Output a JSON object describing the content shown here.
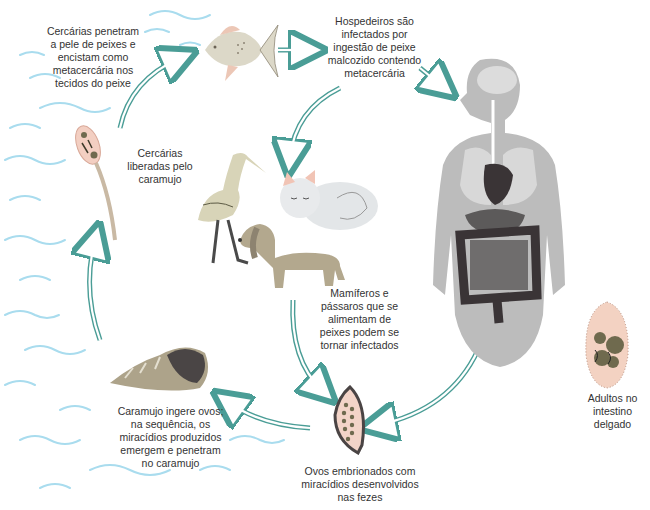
{
  "diagram": {
    "title": "",
    "type": "life-cycle",
    "stages": [
      {
        "id": "fish",
        "label": "Cercárias penetram\na pele de peixes e\nencistam como\nmetacercária nos\ntecidos do peixe"
      },
      {
        "id": "hosts",
        "label": "Hospedeiros são\ninfectados por\ningestão de peixe\nmalcozido contendo\nmetacercária"
      },
      {
        "id": "cercariae",
        "label": "Cercárias\nliberadas pelo\ncaramujo"
      },
      {
        "id": "animals",
        "label": "Mamíferos e\npássaros que se\nalimentam de\npeixes podem se\ntornar infectados"
      },
      {
        "id": "snail",
        "label": "Caramujo ingere ovos;\nna sequência, os\nmiracídios produzidos\nemergem e penetram\nno caramujo"
      },
      {
        "id": "eggs",
        "label": "Ovos embrionados com\nmiracídios desenvolvidos\nnas fezes"
      },
      {
        "id": "adults",
        "label": "Adultos no\nintestino\ndelgado"
      }
    ],
    "colors": {
      "arrow": "#4a9d96",
      "water": "#8fd0e6",
      "body": "#b9b9b9",
      "organ_dark": "#3a3436",
      "fluke": "#f3d2c2",
      "snail": "#a99f86",
      "dog": "#b0a58b"
    }
  }
}
